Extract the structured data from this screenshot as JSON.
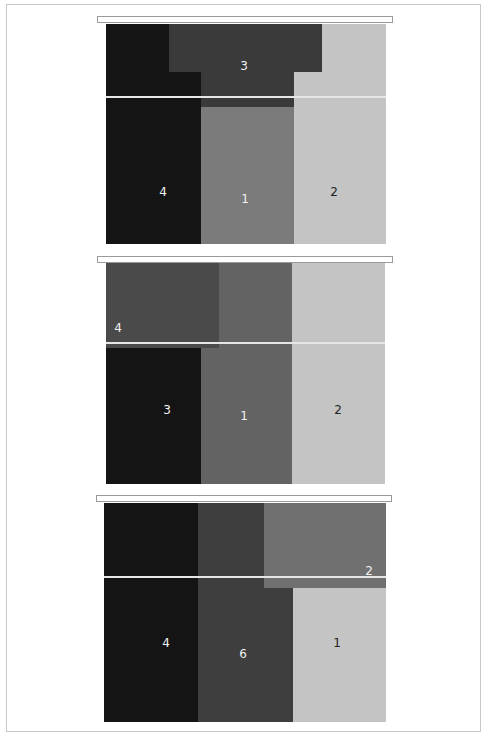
{
  "diagram": {
    "type": "stacked block layout panels",
    "panels": [
      {
        "id": "panel-1",
        "blocks": [
          {
            "label": "4",
            "color": "#141414"
          },
          {
            "label": "3",
            "color": "#3a3a3a"
          },
          {
            "label": "1",
            "color": "#7b7b7b"
          },
          {
            "label": "2",
            "color": "#c4c4c4"
          }
        ]
      },
      {
        "id": "panel-2",
        "blocks": [
          {
            "label": "4",
            "color": "#4a4a4a"
          },
          {
            "label": "3",
            "color": "#141414"
          },
          {
            "label": "1",
            "color": "#636363"
          },
          {
            "label": "2",
            "color": "#c4c4c4"
          }
        ]
      },
      {
        "id": "panel-3",
        "blocks": [
          {
            "label": "4",
            "color": "#141414"
          },
          {
            "label": "6",
            "color": "#3e3e3e"
          },
          {
            "label": "2",
            "color": "#707070"
          },
          {
            "label": "1",
            "color": "#c4c4c4"
          }
        ]
      }
    ]
  }
}
